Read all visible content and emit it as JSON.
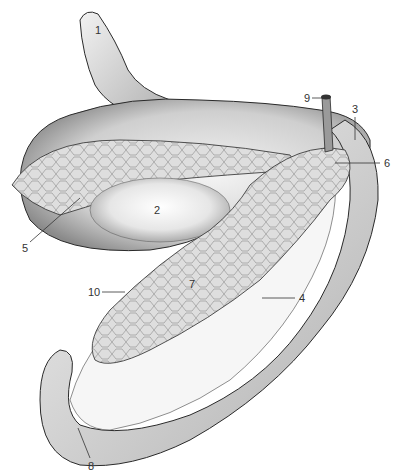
{
  "figure": {
    "type": "anatomical-illustration",
    "labels": [
      {
        "id": "1",
        "text": "1",
        "x": 95,
        "y": 30
      },
      {
        "id": "2",
        "text": "2",
        "x": 154,
        "y": 206
      },
      {
        "id": "3",
        "text": "3",
        "x": 353,
        "y": 105
      },
      {
        "id": "4",
        "text": "4",
        "x": 300,
        "y": 295
      },
      {
        "id": "5",
        "text": "5",
        "x": 22,
        "y": 244
      },
      {
        "id": "6",
        "text": "6",
        "x": 385,
        "y": 160
      },
      {
        "id": "7",
        "text": "7",
        "x": 190,
        "y": 282
      },
      {
        "id": "8",
        "text": "8",
        "x": 88,
        "y": 463
      },
      {
        "id": "9",
        "text": "9",
        "x": 305,
        "y": 95
      },
      {
        "id": "10",
        "text": "10",
        "x": 89,
        "y": 289
      }
    ],
    "colors": {
      "outline": "#2a2a2a",
      "tissue": "#e4e4e4",
      "shade": "#9a9a9a",
      "gland": "#c8c8c8",
      "background": "#ffffff"
    }
  }
}
